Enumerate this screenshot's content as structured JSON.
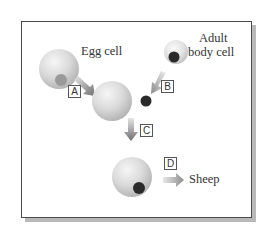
{
  "diagram": {
    "labels": {
      "egg_cell": "Egg cell",
      "adult_line1": "Adult",
      "adult_line2": "body cell",
      "sheep": "Sheep"
    },
    "steps": [
      {
        "id": "A",
        "label": "A"
      },
      {
        "id": "B",
        "label": "B"
      },
      {
        "id": "C",
        "label": "C"
      },
      {
        "id": "D",
        "label": "D"
      }
    ],
    "colors": {
      "cell_fill": "#d9d9d9",
      "cell_highlight": "#f4f4f4",
      "egg_nucleus": "#9a9a9a",
      "dark_nucleus": "#2a2a2a",
      "arrow": "#8a8a8a",
      "frame": "#4a4a4a",
      "shadow": "#b9b9b9"
    }
  }
}
